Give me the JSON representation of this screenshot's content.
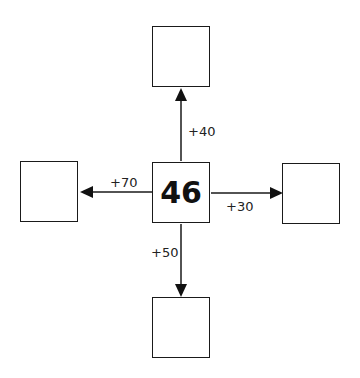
{
  "diagram": {
    "center": {
      "value": "46"
    },
    "branches": {
      "up": {
        "operation": "+40",
        "result": ""
      },
      "right": {
        "operation": "+30",
        "result": ""
      },
      "down": {
        "operation": "+50",
        "result": ""
      },
      "left": {
        "operation": "+70",
        "result": ""
      }
    }
  },
  "colors": {
    "stroke": "#1a1a1a",
    "background": "#ffffff"
  }
}
